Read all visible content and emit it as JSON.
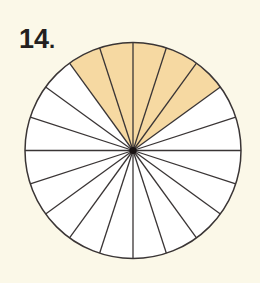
{
  "problem": {
    "number": "14",
    "punctuation": "."
  },
  "diagram": {
    "type": "fraction-circle",
    "total_parts": 20,
    "shaded_parts": 5,
    "shaded_start_angle_deg": 36,
    "shaded_end_angle_deg": 126,
    "center": [
      133,
      150.5
    ],
    "radius": 108,
    "colors": {
      "background": "#fbf8e8",
      "shaded_fill": "#f6d9a2",
      "unshaded_fill": "#ffffff",
      "stroke": "#3a3535",
      "center_dot": "#1a1414"
    }
  }
}
